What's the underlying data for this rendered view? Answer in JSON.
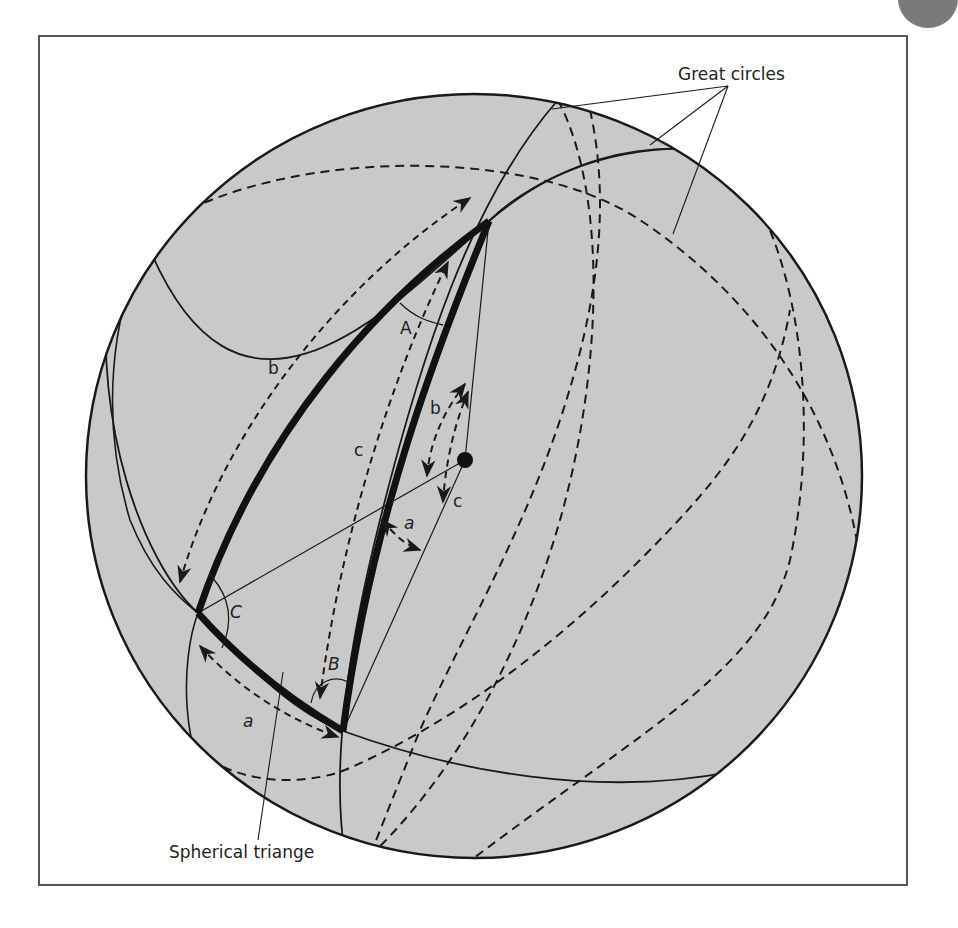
{
  "diagram": {
    "sphere_fill": "#c9c9c9",
    "line_color": "#1a1a1a",
    "callouts": {
      "great_circles": "Great circles",
      "spherical_triangle": "Spherical triange"
    },
    "vertex_angles": {
      "A": "A",
      "B": "B",
      "C": "C"
    },
    "arc_labels": {
      "outer_b": "b",
      "outer_c": "c",
      "outer_a": "a",
      "center_b": "b",
      "center_c": "c",
      "center_a": "a"
    }
  }
}
